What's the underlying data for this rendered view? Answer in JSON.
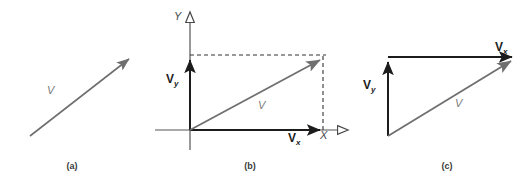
{
  "figure": {
    "background_color": "#ffffff",
    "gray_vector_color": "#6f6f6f",
    "black_vector_color": "#1c1c1c",
    "axis_color": "#555555",
    "dashed_color": "#333333",
    "width": 527,
    "height": 185
  },
  "panels": [
    {
      "id": "a",
      "caption": "(a)",
      "caption_x": 52,
      "caption_y": 161,
      "vectors": [
        {
          "name": "resultant-vector",
          "label": "V",
          "label_x": 47,
          "label_y": 84,
          "color": "#6f6f6f",
          "x1": 30,
          "y1": 136,
          "x2": 131,
          "y2": 57
        }
      ]
    },
    {
      "id": "b",
      "caption": "(b)",
      "caption_x": 230,
      "caption_y": 161,
      "axes": {
        "x_label": "X",
        "x_label_x": 320,
        "x_label_y": 130,
        "y_label": "Y",
        "y_label_x": 174,
        "y_label_y": 10,
        "origin_x": 190,
        "origin_y": 130
      },
      "vectors": [
        {
          "name": "y-component-vector",
          "label": "V",
          "sub": "y",
          "label_x": 166,
          "label_y": 72,
          "color": "#1c1c1c",
          "x1": 190,
          "y1": 130,
          "x2": 190,
          "y2": 57
        },
        {
          "name": "x-component-vector",
          "label": "V",
          "sub": "x",
          "label_x": 288,
          "label_y": 131,
          "color": "#1c1c1c",
          "x1": 190,
          "y1": 130,
          "x2": 323,
          "y2": 130
        },
        {
          "name": "resultant-vector",
          "label": "V",
          "label_x": 258,
          "label_y": 99,
          "color": "#6f6f6f",
          "x1": 190,
          "y1": 130,
          "x2": 322,
          "y2": 58
        }
      ],
      "dashed_lines": [
        {
          "name": "horizontal-projection-line",
          "x1": 190,
          "y1": 55,
          "x2": 325,
          "y2": 55
        },
        {
          "name": "vertical-projection-line",
          "x1": 323,
          "y1": 57,
          "x2": 323,
          "y2": 132
        }
      ]
    },
    {
      "id": "c",
      "caption": "(c)",
      "caption_x": 427,
      "caption_y": 161,
      "vectors": [
        {
          "name": "y-component-vector",
          "label": "V",
          "sub": "y",
          "label_x": 363,
          "label_y": 78,
          "color": "#1c1c1c",
          "x1": 388,
          "y1": 136,
          "x2": 388,
          "y2": 60
        },
        {
          "name": "x-component-vector",
          "label": "V",
          "sub": "x",
          "label_x": 495,
          "label_y": 40,
          "color": "#1c1c1c",
          "x1": 388,
          "y1": 57,
          "x2": 515,
          "y2": 57
        },
        {
          "name": "resultant-vector",
          "label": "V",
          "label_x": 455,
          "label_y": 97,
          "color": "#6f6f6f",
          "x1": 388,
          "y1": 136,
          "x2": 513,
          "y2": 59
        }
      ]
    }
  ]
}
